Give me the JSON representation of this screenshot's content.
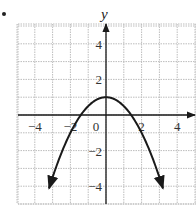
{
  "chart_data": {
    "type": "line",
    "title": "",
    "xlabel": "",
    "ylabel": "y",
    "function": "y = 1 - x^2/2",
    "xlim": [
      -5,
      5
    ],
    "ylim": [
      -5,
      5
    ],
    "grid": true,
    "x_ticks": [
      {
        "value": -4,
        "label": "−4"
      },
      {
        "value": -2,
        "label": "−2"
      },
      {
        "value": 0,
        "label": "0"
      },
      {
        "value": 2,
        "label": "2"
      },
      {
        "value": 4,
        "label": "4"
      }
    ],
    "y_ticks": [
      {
        "value": 4,
        "label": "4"
      },
      {
        "value": 2,
        "label": "2"
      },
      {
        "value": -2,
        "label": "−2"
      },
      {
        "value": -4,
        "label": "−4"
      }
    ],
    "series": [
      {
        "name": "parabola",
        "x": [
          -3.2,
          -3,
          -2.5,
          -2,
          -1.5,
          -1,
          -0.5,
          0,
          0.5,
          1,
          1.5,
          2,
          2.5,
          3,
          3.2
        ],
        "y": [
          -4.12,
          -3.5,
          -2.125,
          -1,
          -0.125,
          0.5,
          0.875,
          1,
          0.875,
          0.5,
          -0.125,
          -1,
          -2.125,
          -3.5,
          -4.12
        ],
        "vertex": [
          0,
          1
        ],
        "x_intercepts": [
          -1.41,
          1.41
        ],
        "arrows_both_ends": true
      }
    ],
    "colors": {
      "curve": "#1a1a1a",
      "grid": "#bdbdbd",
      "axes": "#1a1a1a"
    }
  }
}
